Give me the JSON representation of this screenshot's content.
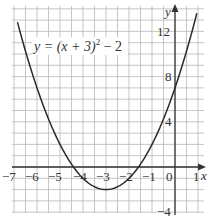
{
  "chart_data": {
    "type": "line",
    "title": "",
    "equation": "y = (x + 3)² − 2",
    "xlabel": "x",
    "ylabel": "y",
    "xlim": [
      -7,
      1.4
    ],
    "ylim": [
      -4.5,
      14
    ],
    "x_ticks": [
      "−7",
      "−6",
      "−5",
      "−4",
      "−3",
      "−2",
      "−1",
      "0",
      "1"
    ],
    "y_ticks": [
      "12",
      "8",
      "4",
      "−4"
    ],
    "grid": true,
    "series": [
      {
        "name": "y = (x + 3)^2 - 2",
        "x": [
          -7,
          -6.5,
          -6,
          -5.5,
          -5,
          -4.5,
          -4,
          -3.5,
          -3,
          -2.5,
          -2,
          -1.5,
          -1,
          -0.5,
          0,
          0.5,
          1
        ],
        "values": [
          14,
          10.25,
          7,
          4.25,
          2,
          0.25,
          -1,
          -1.75,
          -2,
          -1.75,
          -1,
          0.25,
          2,
          4.25,
          7,
          10.25,
          14
        ]
      }
    ]
  },
  "labels": {
    "equation_prefix": "y = (x + 3)",
    "equation_exp": "2",
    "equation_suffix": " − 2",
    "x_axis": "x",
    "y_axis": "y",
    "xt": [
      "−7",
      "−6",
      "−5",
      "−4",
      "−3",
      "−2",
      "−1",
      "0",
      "1"
    ],
    "yt12": "12",
    "yt8": "8",
    "yt4": "4",
    "ytm4": "−4"
  }
}
